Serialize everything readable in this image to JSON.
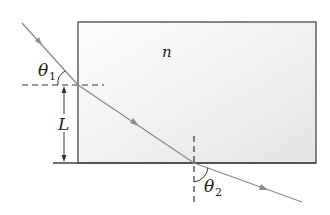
{
  "diagram": {
    "labels": {
      "n": "n",
      "L": "L",
      "theta1": "θ",
      "theta1_sub": "1",
      "theta2": "θ",
      "theta2_sub": "2"
    },
    "colors": {
      "slab_fill_light": "#fbfbfb",
      "slab_fill_dark": "#e6e6e6",
      "slab_border": "#555555",
      "ray": "#8a8a8a",
      "dashed": "#333333",
      "text": "#222222"
    },
    "elements": [
      "slab",
      "incident-ray",
      "refracted-ray",
      "emergent-ray",
      "normal-entry",
      "normal-exit",
      "height-arrow-L",
      "bottom-baseline"
    ]
  }
}
